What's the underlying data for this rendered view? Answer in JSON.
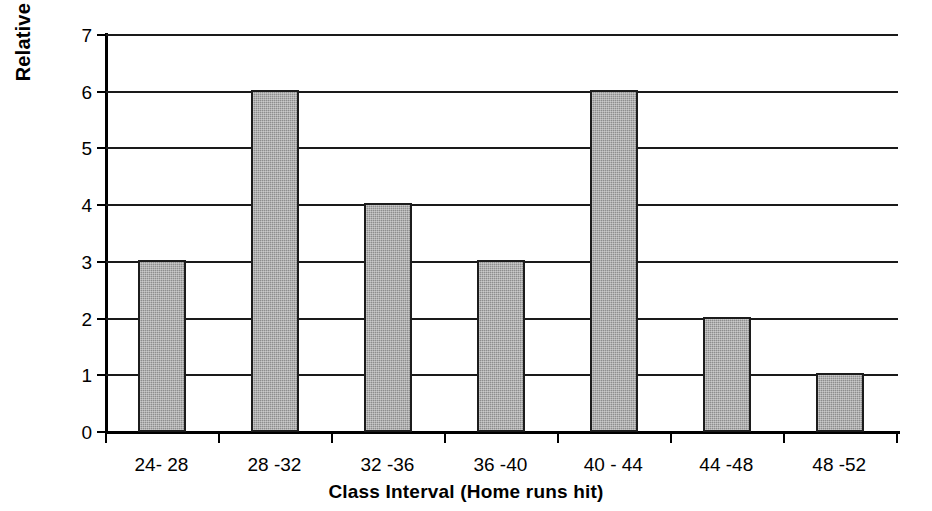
{
  "chart_data": {
    "type": "bar",
    "title": "",
    "xlabel": "Class Interval (Home runs hit)",
    "ylabel": "Relative Frequency in %",
    "categories": [
      "24- 28",
      "28 -32",
      "32 -36",
      "36 -40",
      "40 - 44",
      "44 -48",
      "48 -52"
    ],
    "values": [
      3,
      6,
      4,
      3,
      6,
      2,
      1
    ],
    "ylim": [
      0,
      7
    ],
    "y_ticks": [
      "0",
      "1",
      "2",
      "3",
      "4",
      "5",
      "6",
      "7"
    ],
    "grid": true,
    "legend": "none",
    "bar_color": "#8d8d8d",
    "bar_border_color": "#1c1c1c",
    "axis_color": "#000000",
    "background_color": "#ffffff"
  }
}
